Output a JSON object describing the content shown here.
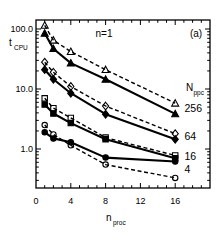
{
  "figure": {
    "annotation": "n=1",
    "panel_label": "(a)",
    "y_axis_label": {
      "main": "t",
      "sub": "CPU"
    },
    "x_axis_label": {
      "main": "n",
      "sub": "proc"
    },
    "legend_title": {
      "main": "N",
      "sub": "ppc"
    }
  },
  "chart_data": {
    "type": "line",
    "annotation": "n=1",
    "panel": "(a)",
    "xlabel": "n_proc",
    "ylabel": "t_CPU",
    "x_scale": "linear",
    "y_scale": "log",
    "xlim": [
      0,
      20
    ],
    "ylim": [
      0.22,
      140
    ],
    "grid": false,
    "legend_position": "right-inside",
    "x": [
      1,
      2,
      4,
      8,
      16
    ],
    "x_ticks": [
      0,
      4,
      8,
      12,
      16
    ],
    "x_tick_labels": [
      "0",
      "4",
      "8",
      "12",
      "16"
    ],
    "y_ticks": [
      1,
      10,
      100
    ],
    "y_tick_labels": [
      "1.0",
      "10.0",
      "100.0"
    ],
    "groups": [
      {
        "label": "256",
        "marker": "triangle",
        "series": [
          {
            "name": "Nppc=256 dashed",
            "style": "dashed",
            "marker_fill": "open",
            "values": [
              115,
              65,
              42,
              21,
              5.8
            ]
          },
          {
            "name": "Nppc=256 solid",
            "style": "solid",
            "marker_fill": "filled",
            "values": [
              85,
              47,
              27,
              14.5,
              3.85
            ]
          }
        ]
      },
      {
        "label": "64",
        "marker": "diamond",
        "series": [
          {
            "name": "Nppc=64 dashed",
            "style": "dashed",
            "marker_fill": "open",
            "values": [
              28,
              19,
              11,
              5.2,
              1.8
            ]
          },
          {
            "name": "Nppc=64 solid",
            "style": "solid",
            "marker_fill": "filled",
            "values": [
              21,
              14.5,
              8.5,
              3.8,
              1.45
            ]
          }
        ]
      },
      {
        "label": "16",
        "marker": "square",
        "series": [
          {
            "name": "Nppc=16 dashed",
            "style": "dashed",
            "marker_fill": "open",
            "values": [
              7.0,
              4.8,
              3.3,
              1.55,
              0.78
            ]
          },
          {
            "name": "Nppc=16 solid",
            "style": "solid",
            "marker_fill": "filled",
            "values": [
              5.5,
              3.9,
              2.7,
              1.45,
              0.7
            ]
          }
        ]
      },
      {
        "label": "4",
        "marker": "circle",
        "series": [
          {
            "name": "Nppc=4 dashed",
            "style": "dashed",
            "marker_fill": "open",
            "values": [
              2.5,
              1.75,
              1.15,
              0.55,
              0.33
            ]
          },
          {
            "name": "Nppc=4 solid",
            "style": "solid",
            "marker_fill": "filled",
            "values": [
              1.9,
              1.5,
              1.3,
              0.72,
              0.62
            ]
          }
        ]
      }
    ],
    "colors": {
      "foreground": "#000000",
      "background": "#ffffff"
    }
  }
}
